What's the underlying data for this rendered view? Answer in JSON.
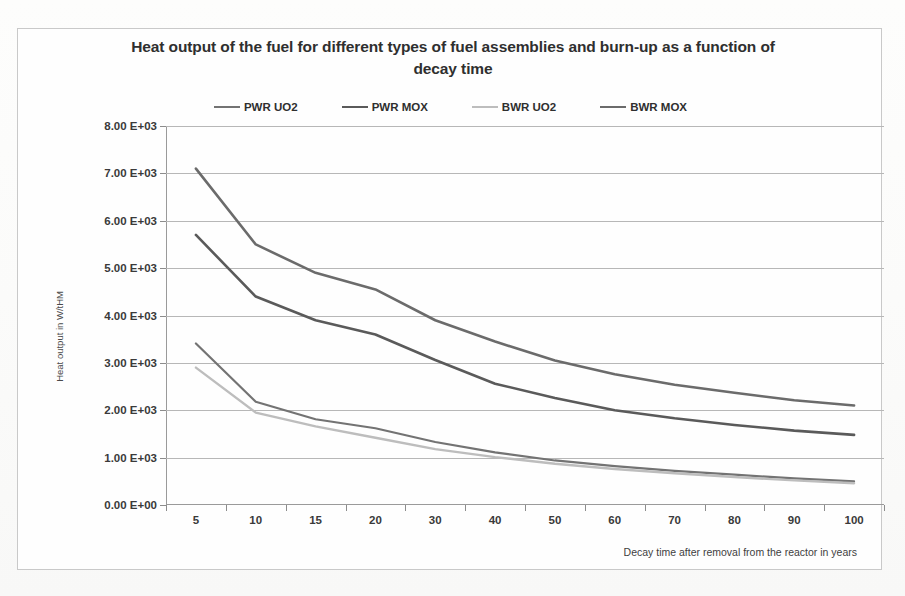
{
  "chart_data": {
    "type": "line",
    "title": "Heat output of the fuel for different types of fuel assemblies and burn-up as a function of decay time",
    "xlabel": "Decay time after removal from the reactor in years",
    "ylabel": "Heat output in W/tHM",
    "categories": [
      "5",
      "10",
      "15",
      "20",
      "30",
      "40",
      "50",
      "60",
      "70",
      "80",
      "90",
      "100"
    ],
    "ytick_labels": [
      "8.00 E+03",
      "7.00 E+03",
      "6.00 E+03",
      "5.00 E+03",
      "4.00 E+03",
      "3.00 E+03",
      "2.00 E+03",
      "1.00 E+03",
      "0.00 E+00"
    ],
    "ytick_values": [
      8000,
      7000,
      6000,
      5000,
      4000,
      3000,
      2000,
      1000,
      0
    ],
    "ylim": [
      0,
      8000
    ],
    "grid": true,
    "legend_position": "top",
    "series": [
      {
        "name": "PWR UO2",
        "color": "#737373",
        "width": 2.2,
        "values": [
          3410,
          2180,
          1810,
          1620,
          1330,
          1110,
          940,
          820,
          720,
          640,
          560,
          500
        ]
      },
      {
        "name": "PWR MOX",
        "color": "#5a5a5a",
        "width": 2.6,
        "values": [
          5700,
          4400,
          3900,
          3600,
          3060,
          2560,
          2260,
          2000,
          1830,
          1690,
          1570,
          1480
        ]
      },
      {
        "name": "BWR UO2",
        "color": "#bdbdbd",
        "width": 2.4,
        "values": [
          2900,
          1950,
          1660,
          1420,
          1180,
          1010,
          870,
          760,
          670,
          590,
          520,
          460
        ]
      },
      {
        "name": "BWR MOX",
        "color": "#6b6b6b",
        "width": 2.6,
        "values": [
          7100,
          5500,
          4900,
          4550,
          3900,
          3450,
          3050,
          2760,
          2540,
          2370,
          2210,
          2100
        ]
      }
    ]
  }
}
